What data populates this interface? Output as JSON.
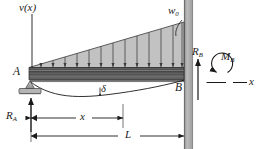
{
  "figure": {
    "type": "engineering-beam-diagram",
    "colors": {
      "line": "#1a1a1a",
      "load_fill": "#b9b9b9",
      "beam_dark": "#4a4a4a",
      "beam_mid": "#6e6e6e",
      "beam_light": "#a8a8a8",
      "wall_fill": "#a9a9a9",
      "support_fill": "#b0b0b0",
      "background": "#ffffff"
    }
  },
  "labels": {
    "deflection_axis": {
      "text": "v(x)",
      "name": "v-of-x"
    },
    "load_intensity": {
      "base": "w",
      "sub": "0",
      "name": "w-zero"
    },
    "point_a": {
      "text": "A",
      "name": "point-A"
    },
    "point_b": {
      "text": "B",
      "name": "point-B"
    },
    "reaction_a": {
      "base": "R",
      "sub": "A",
      "name": "R-A"
    },
    "reaction_b": {
      "base": "R",
      "sub": "B",
      "name": "R-B"
    },
    "moment_b": {
      "base": "M",
      "sub": "B",
      "name": "M-B"
    },
    "deflection": {
      "text": "δ",
      "name": "delta"
    },
    "axis_x": {
      "text": "x",
      "name": "x-axis"
    },
    "dim_x": {
      "text": "x",
      "name": "dimension-x"
    },
    "dim_l": {
      "text": "L",
      "name": "dimension-L"
    }
  },
  "geometry": {
    "beam_left_x": 28,
    "beam_right_x": 184,
    "beam_top_y": 69,
    "beam_bottom_y": 80,
    "load_apex_y": 22,
    "load_arrow_count": 13,
    "wall_x": 184,
    "wall_width": 9,
    "dim_x_end": 123,
    "max_deflection_x": 100
  }
}
